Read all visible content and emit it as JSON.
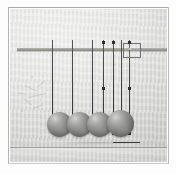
{
  "image": {
    "title": "Newton's cradle pendulum apparatus",
    "subject": "newtons-cradle",
    "medium": "black-and-white photograph",
    "width_px": 176,
    "height_px": 174,
    "border": {
      "style": "white photographic margin with thin grey rule",
      "margin_color": "#fdfdfd",
      "rule_color": "#a9a9a9"
    },
    "background": {
      "description": "light grey textured plaster wall",
      "color_light": "#e7e7e6",
      "color_dark": "#cfcfcd"
    }
  },
  "apparatus": {
    "support_bar": {
      "label": "horizontal support bar",
      "color": "#9d9d9a",
      "y_px": 39,
      "x_start_px": 17,
      "x_end_px": 167
    },
    "shelf_line": {
      "label": "bottom shelf edge",
      "y_px": 147,
      "color": "#5a5a5a"
    },
    "sight_box": {
      "label": "sighting box",
      "x_px": 113,
      "y_px": 34,
      "width_px": 16,
      "height_px": 13,
      "border_color": "#6f6f74"
    },
    "wires": [
      {
        "name": "wire-1",
        "x_px": 52,
        "top_px": 40,
        "bottom_px": 116,
        "color": "#3e3e43"
      },
      {
        "name": "wire-2",
        "x_px": 72,
        "top_px": 40,
        "bottom_px": 116,
        "color": "#3e3e43"
      },
      {
        "name": "wire-3",
        "x_px": 92,
        "top_px": 40,
        "bottom_px": 116,
        "color": "#3e3e43"
      },
      {
        "name": "wire-4",
        "x_px": 103,
        "top_px": 40,
        "bottom_px": 134,
        "color": "#3e3e43"
      },
      {
        "name": "wire-5",
        "x_px": 113,
        "top_px": 40,
        "bottom_px": 116,
        "color": "#3e3e43"
      },
      {
        "name": "wire-6",
        "x_px": 121,
        "top_px": 40,
        "bottom_px": 134,
        "color": "#3e3e43"
      },
      {
        "name": "wire-7",
        "x_px": 129,
        "top_px": 40,
        "bottom_px": 134,
        "color": "#3e3e43"
      }
    ],
    "markers": [
      {
        "name": "marker-left-upper",
        "x_px": 103,
        "y_px": 42
      },
      {
        "name": "marker-mid-upper",
        "x_px": 113,
        "y_px": 42
      },
      {
        "name": "marker-right-upper",
        "x_px": 129,
        "y_px": 42
      },
      {
        "name": "marker-left-mid",
        "x_px": 103,
        "y_px": 88
      },
      {
        "name": "marker-right-mid",
        "x_px": 129,
        "y_px": 88
      },
      {
        "name": "marker-left-low",
        "x_px": 103,
        "y_px": 133
      },
      {
        "name": "marker-mid-low",
        "x_px": 113,
        "y_px": 133
      },
      {
        "name": "marker-right-low",
        "x_px": 129,
        "y_px": 133
      }
    ],
    "balls": [
      {
        "name": "ball-1",
        "cx_px": 59,
        "cy_px": 124,
        "diameter_px": 25
      },
      {
        "name": "ball-2",
        "cx_px": 79,
        "cy_px": 124,
        "diameter_px": 25
      },
      {
        "name": "ball-3",
        "cx_px": 99,
        "cy_px": 124,
        "diameter_px": 25
      },
      {
        "name": "ball-4",
        "cx_px": 120,
        "cy_px": 123,
        "diameter_px": 27
      }
    ],
    "ball_count": 4,
    "ball_material_color": "#8e8e8c"
  },
  "marks": {
    "label": "emulsion scratches and specks",
    "color": "#b9b9b7",
    "scratches": [
      {
        "x_px": 24,
        "y_px": 88,
        "w_px": 14,
        "h_px": 1,
        "rot_deg": 24
      },
      {
        "x_px": 28,
        "y_px": 95,
        "w_px": 18,
        "h_px": 1,
        "rot_deg": -14
      },
      {
        "x_px": 22,
        "y_px": 101,
        "w_px": 11,
        "h_px": 1,
        "rot_deg": 42
      },
      {
        "x_px": 37,
        "y_px": 83,
        "w_px": 9,
        "h_px": 1,
        "rot_deg": -38
      },
      {
        "x_px": 18,
        "y_px": 93,
        "w_px": 7,
        "h_px": 1,
        "rot_deg": 8
      },
      {
        "x_px": 33,
        "y_px": 106,
        "w_px": 10,
        "h_px": 1,
        "rot_deg": -20
      }
    ],
    "specks": [
      {
        "x_px": 31,
        "y_px": 76,
        "d_px": 2
      },
      {
        "x_px": 44,
        "y_px": 72,
        "d_px": 1
      },
      {
        "x_px": 21,
        "y_px": 110,
        "d_px": 2
      },
      {
        "x_px": 40,
        "y_px": 99,
        "d_px": 1
      },
      {
        "x_px": 26,
        "y_px": 119,
        "d_px": 1
      },
      {
        "x_px": 47,
        "y_px": 90,
        "d_px": 1
      },
      {
        "x_px": 114,
        "y_px": 64,
        "d_px": 1
      },
      {
        "x_px": 126,
        "y_px": 70,
        "d_px": 1
      }
    ]
  }
}
